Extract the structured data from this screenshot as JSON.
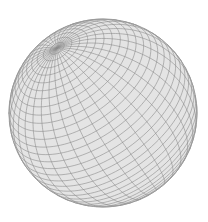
{
  "figure": {
    "width": 208,
    "height": 222,
    "background_color": "#ffffff",
    "sphere": {
      "center_x": 103,
      "center_y": 113,
      "radius": 94,
      "fill_color": "#e4e4e4",
      "edge_color": "#8c8c8c",
      "outline_color": "#9a9a9a",
      "pole_screen_direction": [
        -0.49,
        -0.69,
        0.53
      ],
      "latitude_lines": 36,
      "longitude_lines": 36,
      "line_width": 0.6
    }
  }
}
